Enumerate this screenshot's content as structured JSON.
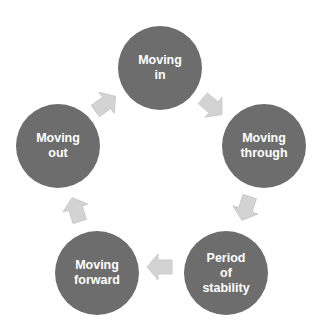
{
  "diagram": {
    "type": "cycle",
    "colors": {
      "node_fill": "#6d6d6d",
      "node_text": "#ffffff",
      "arrow_fill": "#d3d3d3",
      "background": "#ffffff"
    },
    "nodes": [
      {
        "id": "moving-in",
        "label": "Moving\nin"
      },
      {
        "id": "moving-through",
        "label": "Moving\nthrough"
      },
      {
        "id": "period-of-stability",
        "label": "Period\nof\nstability"
      },
      {
        "id": "moving-forward",
        "label": "Moving\nforward"
      },
      {
        "id": "moving-out",
        "label": "Moving\nout"
      }
    ],
    "edges": [
      {
        "from": "moving-in",
        "to": "moving-through"
      },
      {
        "from": "moving-through",
        "to": "period-of-stability"
      },
      {
        "from": "period-of-stability",
        "to": "moving-forward"
      },
      {
        "from": "moving-forward",
        "to": "moving-out"
      },
      {
        "from": "moving-out",
        "to": "moving-in"
      }
    ]
  }
}
